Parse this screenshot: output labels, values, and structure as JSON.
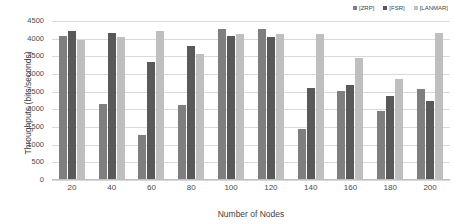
{
  "chart_data": {
    "type": "bar",
    "title": "",
    "xlabel": "Number of Nodes",
    "ylabel": "Throughputs (bits/seconds)",
    "categories": [
      "20",
      "40",
      "60",
      "80",
      "100",
      "120",
      "140",
      "160",
      "180",
      "200"
    ],
    "series": [
      {
        "name": "[ZRP]",
        "color": "#7f7f7f",
        "values": [
          4080,
          2140,
          1270,
          2110,
          4280,
          4280,
          1440,
          2520,
          1960,
          2580
        ]
      },
      {
        "name": "[FSR]",
        "color": "#595959",
        "values": [
          4210,
          4170,
          3340,
          3790,
          4080,
          4050,
          2610,
          2700,
          2380,
          2250
        ]
      },
      {
        "name": "[LANMAR]",
        "color": "#bfbfbf",
        "values": [
          3960,
          4040,
          4220,
          3560,
          4140,
          4140,
          4120,
          3450,
          2850,
          4160
        ]
      }
    ],
    "ylim": [
      0,
      4500
    ],
    "ytick_step": 500,
    "yticks": [
      "4500",
      "4000",
      "3500",
      "3000",
      "2500",
      "2000",
      "1500",
      "1000",
      "500",
      "0"
    ],
    "grid": true,
    "legend_position": "top-right"
  },
  "legend": {
    "items": [
      {
        "label": "[ZRP]",
        "marker": "square-marker"
      },
      {
        "label": "[FSR]",
        "marker": "square-marker"
      },
      {
        "label": "[LANMAR]",
        "marker": "square-marker"
      }
    ]
  },
  "colors": {
    "zrp": "#7f7f7f",
    "fsr": "#595959",
    "lanmar": "#bfbfbf",
    "gridline": "#d9d9d9",
    "text": "#3f3f3f",
    "background": "#ffffff"
  }
}
